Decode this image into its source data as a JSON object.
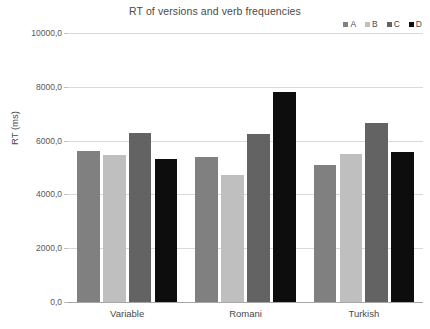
{
  "chart_data": {
    "type": "bar",
    "title": "RT of versions and verb frequencies",
    "xlabel": "",
    "ylabel": "RT (ms)",
    "categories": [
      "Variable",
      "Romani",
      "Turkish"
    ],
    "series": [
      {
        "name": "A",
        "color": "#808080",
        "values": [
          5600,
          5400,
          5080
        ]
      },
      {
        "name": "B",
        "color": "#bfbfbf",
        "values": [
          5480,
          4720,
          5500
        ]
      },
      {
        "name": "C",
        "color": "#636363",
        "values": [
          6300,
          6250,
          6650
        ]
      },
      {
        "name": "D",
        "color": "#0d0d0d",
        "values": [
          5320,
          7800,
          5580
        ]
      }
    ],
    "ylim": [
      0,
      10000
    ],
    "ytick_values": [
      0,
      2000,
      4000,
      6000,
      8000,
      10000
    ],
    "ytick_labels": [
      "0,0",
      "2000,0",
      "4000,0",
      "6000,0",
      "8000,0",
      "10000,0"
    ],
    "grid": true,
    "legend_position": "top-right",
    "legend_entries": [
      {
        "label": "A",
        "color": "#808080"
      },
      {
        "label": "B",
        "color": "#bfbfbf"
      },
      {
        "label": "C",
        "color": "#636363"
      },
      {
        "label": "D",
        "color": "#0d0d0d"
      }
    ]
  }
}
